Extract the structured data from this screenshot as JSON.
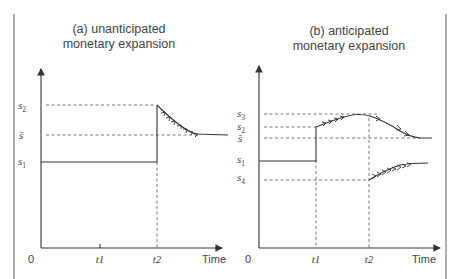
{
  "panels": [
    {
      "id": "a",
      "title_line1": "(a) unanticipated",
      "title_line2": "monetary expansion",
      "y_labels": [
        {
          "base": "s",
          "sub": "2"
        },
        {
          "base": "s̄",
          "sub": ""
        },
        {
          "base": "s",
          "sub": "1"
        }
      ],
      "x_labels": [
        "0",
        "t1",
        "t2",
        "Time"
      ]
    },
    {
      "id": "b",
      "title_line1": "(b) anticipated",
      "title_line2": "monetary expansion",
      "y_labels": [
        {
          "base": "s",
          "sub": "3"
        },
        {
          "base": "s",
          "sub": "2"
        },
        {
          "base": "s̄",
          "sub": ""
        },
        {
          "base": "s",
          "sub": "1"
        },
        {
          "base": "s",
          "sub": "4"
        }
      ],
      "x_labels": [
        "0",
        "t1",
        "t2",
        "Time"
      ]
    }
  ],
  "colors": {
    "line": "#3a3a3a",
    "dash": "#555555",
    "border": "#777777"
  }
}
